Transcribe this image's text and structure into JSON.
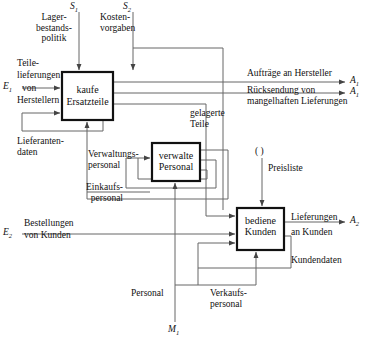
{
  "diagram": {
    "type": "block-flow-diagram",
    "language": "de",
    "line_color": "#555555",
    "box_border_color": "#111111",
    "background": "#ffffff",
    "boxes": [
      {
        "id": "kaufe",
        "line1": "kaufe",
        "line2": "Ersatzteile",
        "x": 62,
        "y": 72,
        "w": 51,
        "h": 48
      },
      {
        "id": "verwalte",
        "line1": "verwalte",
        "line2": "Personal",
        "x": 152,
        "y": 143,
        "w": 48,
        "h": 38
      },
      {
        "id": "bediene",
        "line1": "bediene",
        "line2": "Kunden",
        "x": 237,
        "y": 208,
        "w": 47,
        "h": 42
      }
    ],
    "inputs": [
      {
        "id": "s1",
        "symbol": "S",
        "subscript": "1",
        "label": "Lager-\nbestands-\npolitik"
      },
      {
        "id": "s2",
        "symbol": "S",
        "subscript": "2",
        "label": "Kosten-\nvorgaben"
      },
      {
        "id": "e1",
        "symbol": "E",
        "subscript": "1",
        "label": "Teile-\nlieferungen\nvon\nHerstellern"
      },
      {
        "id": "e2",
        "symbol": "E",
        "subscript": "2",
        "label": "Bestellungen\nvon Kunden"
      },
      {
        "id": "m1",
        "symbol": "M",
        "subscript": "1",
        "label": "Personal"
      }
    ],
    "outputs": [
      {
        "id": "a1a",
        "symbol": "A",
        "subscript": "1",
        "label": "Aufträge an Hersteller"
      },
      {
        "id": "a1b",
        "symbol": "A",
        "subscript": "1",
        "label": "Rücksendung von\nmangelhaften Lieferungen"
      },
      {
        "id": "a2",
        "symbol": "A",
        "subscript": "2",
        "label": "Lieferungen\nan Kunden"
      }
    ],
    "edge_labels": [
      {
        "id": "lager",
        "text": "Lager-\nbestands-\npolitik",
        "x": 28,
        "y": 14
      },
      {
        "id": "kosten",
        "text": "Kosten-\nvorgaben",
        "x": 100,
        "y": 14
      },
      {
        "id": "teile",
        "text": "Teile-",
        "x": 17,
        "y": 60
      },
      {
        "id": "lieferungen",
        "text": "lieferungen",
        "x": 17,
        "y": 72
      },
      {
        "id": "von",
        "text": "von",
        "x": 22,
        "y": 84
      },
      {
        "id": "herstellern",
        "text": "Herstellern",
        "x": 17,
        "y": 96
      },
      {
        "id": "lieferantendaten",
        "text": "Lieferanten-\ndaten",
        "x": 17,
        "y": 140
      },
      {
        "id": "verwaltungspersonal",
        "text": "Verwaltungs-\npersonal",
        "x": 90,
        "y": 151
      },
      {
        "id": "einkaufspersonal",
        "text": "Einkaufs-\npersonal",
        "x": 57,
        "y": 184
      },
      {
        "id": "gelagerte",
        "text": "gelagerte\nTeile",
        "x": 192,
        "y": 110
      },
      {
        "id": "auftraege",
        "text": "Aufträge an Hersteller",
        "x": 247,
        "y": 71
      },
      {
        "id": "ruecksendung",
        "text": "Rücksendung von\nmangelhaften Lieferungen",
        "x": 247,
        "y": 88
      },
      {
        "id": "klammer",
        "text": "( )",
        "x": 265,
        "y": 148
      },
      {
        "id": "preisliste",
        "text": "Preisliste",
        "x": 272,
        "y": 164
      },
      {
        "id": "bestellungen",
        "text": "Bestellungen",
        "x": 24,
        "y": 219
      },
      {
        "id": "vonkunden",
        "text": "von Kunden",
        "x": 24,
        "y": 231
      },
      {
        "id": "lieferungen2",
        "text": "Lieferungen",
        "x": 292,
        "y": 214
      },
      {
        "id": "ankunden",
        "text": "an Kunden",
        "x": 292,
        "y": 228
      },
      {
        "id": "kundendaten",
        "text": "Kundendaten",
        "x": 292,
        "y": 256
      },
      {
        "id": "personal",
        "text": "Personal",
        "x": 134,
        "y": 290
      },
      {
        "id": "verkaufspersonal",
        "text": "Verkaufs-\npersonal",
        "x": 213,
        "y": 290
      }
    ],
    "terminal_symbols": [
      {
        "id": "s1-sym",
        "text": "S",
        "sub": "1",
        "x": 70,
        "y": 2
      },
      {
        "id": "s2-sym",
        "text": "S",
        "sub": "2",
        "x": 123,
        "y": 2
      },
      {
        "id": "e1-sym",
        "text": "E",
        "sub": "1",
        "x": 3,
        "y": 80
      },
      {
        "id": "e2-sym",
        "text": "E",
        "sub": "2",
        "x": 3,
        "y": 224
      },
      {
        "id": "m1-sym",
        "text": "M",
        "sub": "1",
        "x": 168,
        "y": 325
      },
      {
        "id": "a1a-sym",
        "text": "A",
        "sub": "1",
        "x": 350,
        "y": 72
      },
      {
        "id": "a1b-sym",
        "text": "A",
        "sub": "1",
        "x": 350,
        "y": 86
      },
      {
        "id": "a2-sym",
        "text": "A",
        "sub": "2",
        "x": 350,
        "y": 220
      }
    ]
  }
}
